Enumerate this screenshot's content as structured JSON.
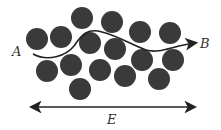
{
  "diagram": {
    "particle_color": "#3a3a3a",
    "line_color": "#222222",
    "particle_radius": 11,
    "particles": [
      {
        "x": 37,
        "y": 39
      },
      {
        "x": 61,
        "y": 37
      },
      {
        "x": 82,
        "y": 18
      },
      {
        "x": 112,
        "y": 22
      },
      {
        "x": 140,
        "y": 32
      },
      {
        "x": 170,
        "y": 33
      },
      {
        "x": 90,
        "y": 43
      },
      {
        "x": 115,
        "y": 49
      },
      {
        "x": 47,
        "y": 71
      },
      {
        "x": 71,
        "y": 65
      },
      {
        "x": 100,
        "y": 70
      },
      {
        "x": 142,
        "y": 60
      },
      {
        "x": 173,
        "y": 60
      },
      {
        "x": 125,
        "y": 76
      },
      {
        "x": 159,
        "y": 79
      },
      {
        "x": 80,
        "y": 89
      }
    ],
    "labels": {
      "start": "A",
      "end": "B",
      "field": "E"
    }
  }
}
